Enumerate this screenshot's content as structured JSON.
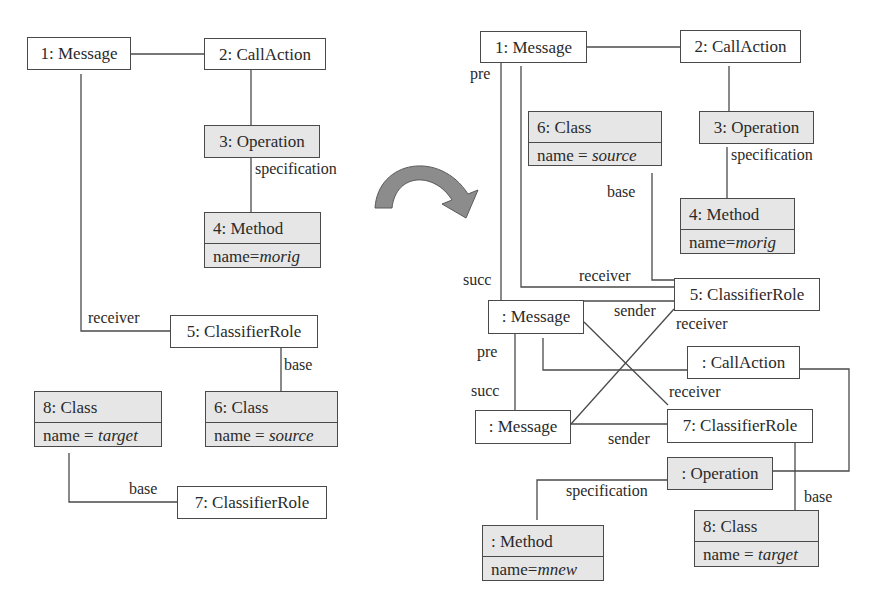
{
  "left_diagram": {
    "nodes": [
      {
        "id": "m1",
        "title": "1: Message",
        "shaded": false
      },
      {
        "id": "ca2",
        "title": "2: CallAction",
        "shaded": false
      },
      {
        "id": "op3",
        "title": "3: Operation",
        "shaded": true
      },
      {
        "id": "me4",
        "title": "4: Method",
        "attr_name": "name=",
        "attr_value": "morig",
        "shaded": true
      },
      {
        "id": "cr5",
        "title": "5: ClassifierRole",
        "shaded": false
      },
      {
        "id": "cl6",
        "title": "6: Class",
        "attr_name": "name = ",
        "attr_value": "source",
        "shaded": true
      },
      {
        "id": "cr7",
        "title": "7: ClassifierRole",
        "shaded": false
      },
      {
        "id": "cl8",
        "title": "8: Class",
        "attr_name": "name = ",
        "attr_value": "target",
        "shaded": true
      }
    ],
    "labels": {
      "specification": "specification",
      "receiver": "receiver",
      "base_5_6": "base",
      "base_8_7": "base"
    }
  },
  "transform_arrow": {
    "icon": "curved-arrow-icon",
    "color": "#8c8c8c"
  },
  "right_diagram": {
    "nodes": [
      {
        "id": "m1",
        "title": "1: Message",
        "shaded": false
      },
      {
        "id": "ca2",
        "title": "2: CallAction",
        "shaded": false
      },
      {
        "id": "op3",
        "title": "3: Operation",
        "shaded": true
      },
      {
        "id": "me4",
        "title": "4: Method",
        "attr_name": "name=",
        "attr_value": "morig",
        "shaded": true
      },
      {
        "id": "cl6",
        "title": "6: Class",
        "attr_name": "name = ",
        "attr_value": "source",
        "shaded": true
      },
      {
        "id": "cr5",
        "title": "5: ClassifierRole",
        "shaded": false
      },
      {
        "id": "msgA",
        "title": ": Message",
        "shaded": false
      },
      {
        "id": "caNew",
        "title": ": CallAction",
        "shaded": false
      },
      {
        "id": "msgB",
        "title": ": Message",
        "shaded": false
      },
      {
        "id": "cr7",
        "title": "7: ClassifierRole",
        "shaded": false
      },
      {
        "id": "opNew",
        "title": ": Operation",
        "shaded": true
      },
      {
        "id": "meNew",
        "title": ": Method",
        "attr_name": "name=",
        "attr_value": "mnew",
        "shaded": true
      },
      {
        "id": "cl8",
        "title": "8: Class",
        "attr_name": "name = ",
        "attr_value": "target",
        "shaded": true
      }
    ],
    "labels": {
      "pre_top": "pre",
      "specification_top": "specification",
      "base_6_5": "base",
      "succ_top": "succ",
      "receiver_1_5": "receiver",
      "sender_a_5": "sender",
      "receiver_b_5": "receiver",
      "pre_mid": "pre",
      "succ_mid": "succ",
      "receiver_a_7": "receiver",
      "sender_b_7": "sender",
      "specification_bottom": "specification",
      "base_7_8": "base"
    }
  }
}
